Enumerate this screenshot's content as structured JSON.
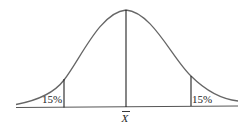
{
  "diagram": {
    "type": "normal-distribution-curve",
    "left_tail": {
      "label": "15%"
    },
    "right_tail": {
      "label": "15%"
    },
    "center": {
      "label": "X",
      "overline": true
    },
    "colors": {
      "curve": "#555555",
      "lines": "#222222",
      "text": "#222222"
    }
  }
}
